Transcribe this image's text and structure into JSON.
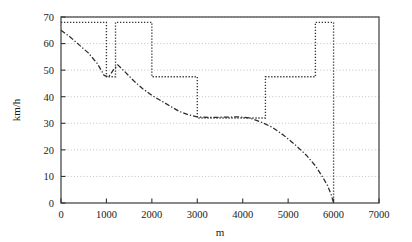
{
  "chart_data": {
    "type": "line",
    "title": "",
    "subtitle": "",
    "xlabel": "m",
    "ylabel": "km/h",
    "xlim": [
      0,
      7000
    ],
    "ylim": [
      0,
      70
    ],
    "grid": true,
    "grid_axis": "y",
    "legend": null,
    "legend_position": "none",
    "xticks": [
      0,
      1000,
      2000,
      3000,
      4000,
      5000,
      6000,
      7000
    ],
    "xticklabels": [
      "0",
      "1000",
      "2000",
      "3000",
      "4000",
      "5000",
      "6000",
      "7000"
    ],
    "yticks": [
      0,
      10,
      20,
      30,
      40,
      50,
      60,
      70
    ],
    "yticklabels": [
      "0",
      "10",
      "20",
      "30",
      "40",
      "50",
      "60",
      "70"
    ],
    "series": [
      {
        "name": "speed-limit",
        "style": "dotted",
        "color": "#333333",
        "drawstyle": "steps-post",
        "x": [
          0,
          1000,
          1000,
          1200,
          1200,
          2000,
          2000,
          3000,
          3000,
          4500,
          4500,
          5600,
          5600,
          6000,
          6000
        ],
        "values": [
          68,
          68,
          47.5,
          47.5,
          68,
          68,
          47.5,
          47.5,
          32,
          32,
          47.5,
          47.5,
          68,
          68,
          0
        ]
      },
      {
        "name": "actual-speed",
        "style": "dashdot",
        "color": "#2b2b2b",
        "drawstyle": "default",
        "x": [
          0,
          200,
          400,
          600,
          800,
          950,
          1050,
          1150,
          1250,
          1400,
          1600,
          1800,
          2000,
          2200,
          2400,
          2600,
          2800,
          3000,
          3300,
          3600,
          3900,
          4150,
          4400,
          4650,
          4900,
          5150,
          5400,
          5600,
          5750,
          5870,
          5950,
          6000
        ],
        "values": [
          65,
          62.5,
          59.5,
          56.5,
          52.5,
          48,
          47.5,
          50,
          52,
          49.5,
          46,
          43,
          40.5,
          38.5,
          36.5,
          34.5,
          33.2,
          32.4,
          32.2,
          32.3,
          32.4,
          32,
          30.5,
          28.5,
          25.5,
          22,
          18,
          14,
          10,
          6.5,
          3,
          0
        ]
      }
    ]
  }
}
